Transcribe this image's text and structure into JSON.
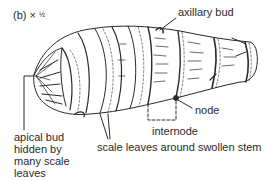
{
  "figure": {
    "label": "(b) ×",
    "magnification_fraction": "½",
    "stroke_color": "#2a2a2a",
    "background": "#ffffff"
  },
  "labels": {
    "axillary_bud": "axillary bud",
    "node": "node",
    "internode": "internode",
    "scale_leaves": "scale leaves around swollen stem",
    "apical_bud": "apical bud\nhidden by\nmany scale\nleaves"
  }
}
